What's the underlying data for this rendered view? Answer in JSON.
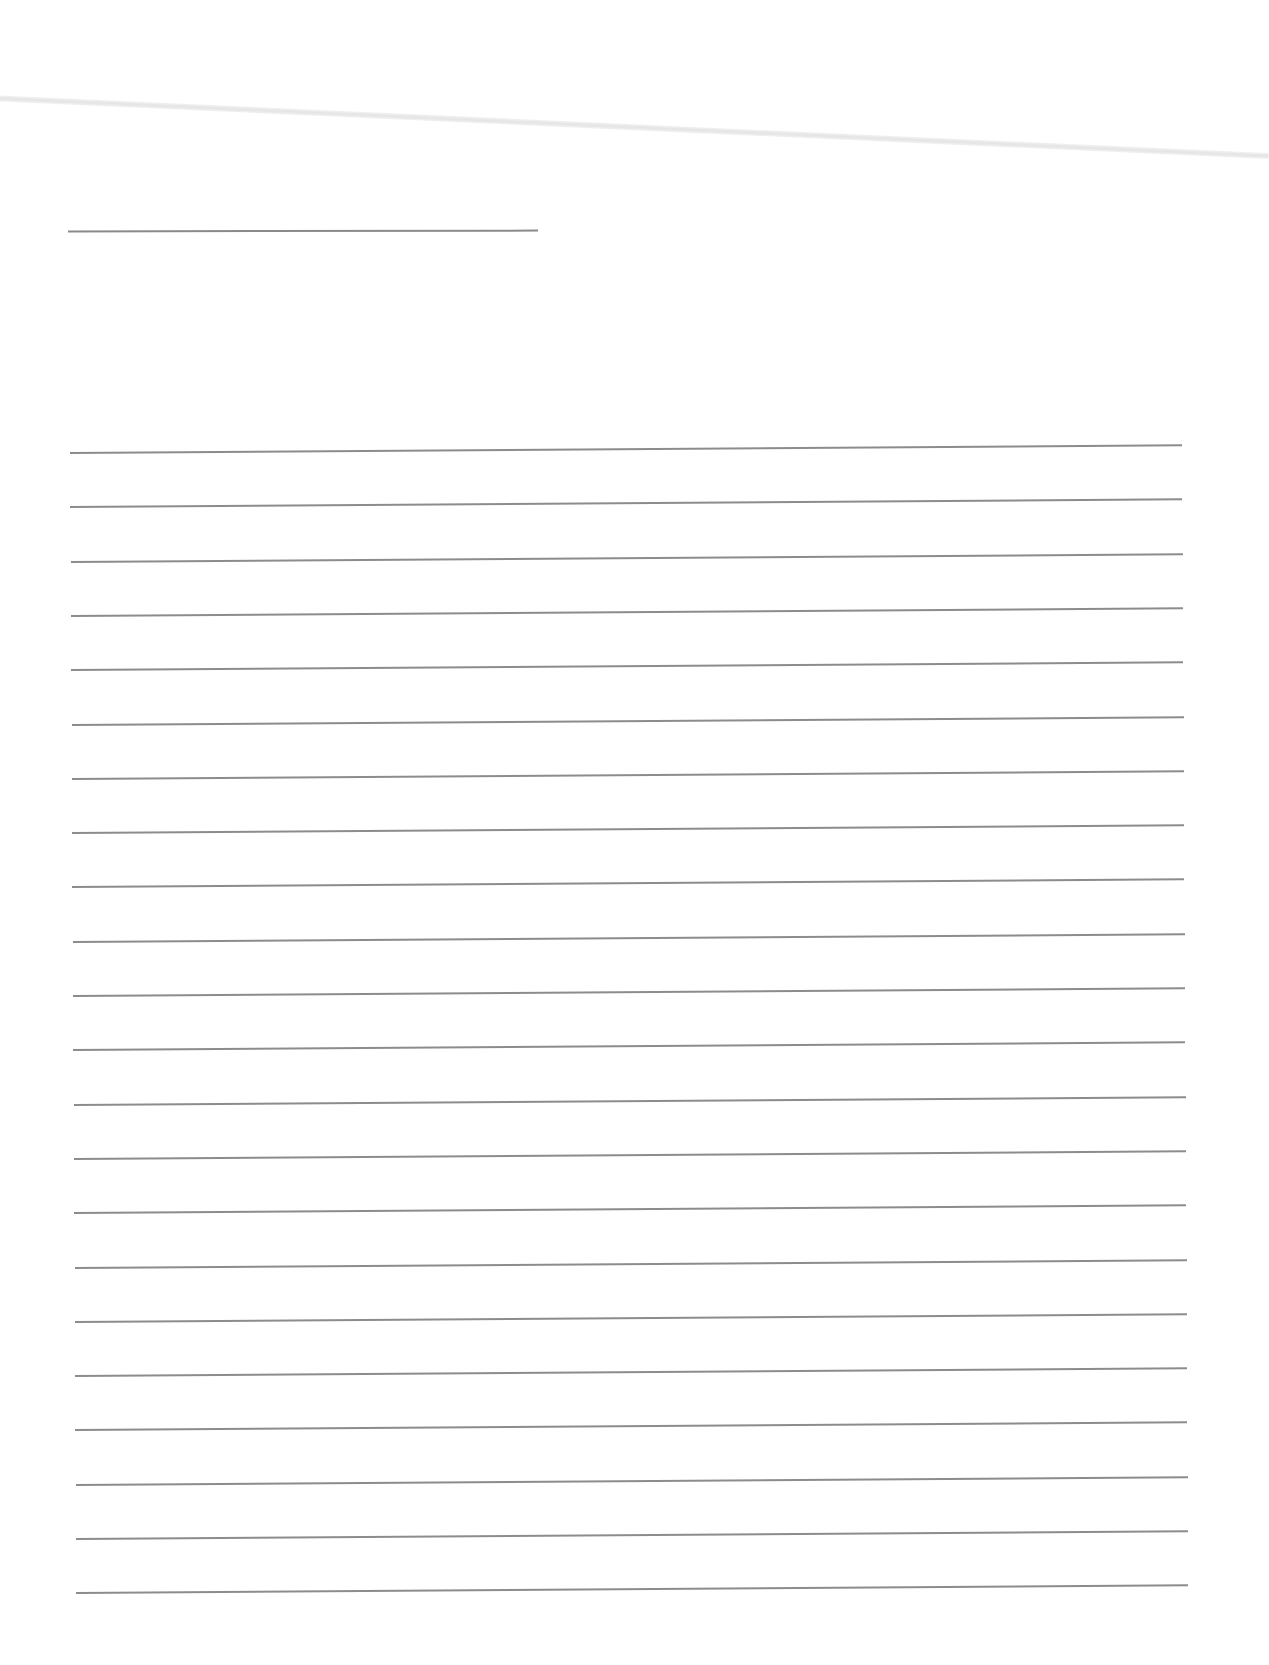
{
  "document": {
    "type": "blank lined sheet",
    "title_line": {
      "x": 68,
      "y": 230,
      "width": 470
    },
    "rules": {
      "count": 22,
      "first_y": 452,
      "spacing": 54.3,
      "left_x": 70,
      "right_x": 1182,
      "color": "#8c8c8c"
    }
  }
}
